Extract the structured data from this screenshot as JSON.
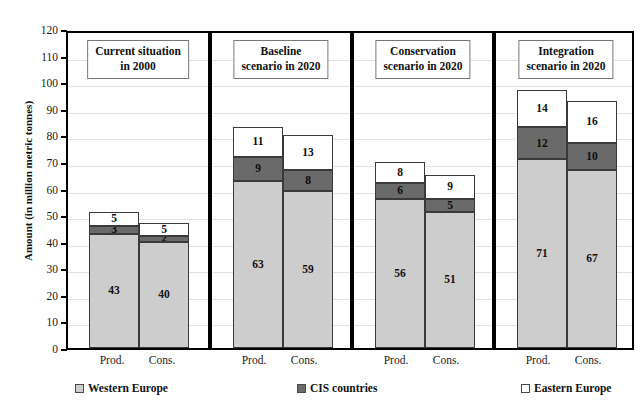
{
  "chart_data": {
    "type": "bar",
    "title": "in 2020 under the three alternative scenarios",
    "xlabel": "",
    "ylabel": "Amount (in million metric tonnes)",
    "ylim": [
      0,
      120
    ],
    "ytick_step": 10,
    "yticks": [
      "0",
      "10",
      "20",
      "30",
      "40",
      "50",
      "60",
      "70",
      "80",
      "90",
      "100",
      "110",
      "120"
    ],
    "grid": true,
    "legend_position": "bottom",
    "stacked": true,
    "series": [
      {
        "name": "Western Europe",
        "color": "#cdcdcd"
      },
      {
        "name": "CIS countries",
        "color": "#6a6a6a"
      },
      {
        "name": "Eastern Europe",
        "color": "#ffffff"
      }
    ],
    "panels": [
      {
        "header": "Current   situation\nin 2000",
        "header_line1": "Current   situation",
        "header_line2": "in 2000",
        "bars": [
          {
            "category": "Prod.",
            "western": 43,
            "cis": 3,
            "eastern": 5,
            "total": 51
          },
          {
            "category": "Cons.",
            "western": 40,
            "cis": 2,
            "eastern": 5,
            "total": 47
          }
        ]
      },
      {
        "header": "Baseline\nscenario in 2020",
        "header_line1": "Baseline",
        "header_line2": "scenario in 2020",
        "bars": [
          {
            "category": "Prod.",
            "western": 63,
            "cis": 9,
            "eastern": 11,
            "total": 83
          },
          {
            "category": "Cons.",
            "western": 59,
            "cis": 8,
            "eastern": 13,
            "total": 80
          }
        ]
      },
      {
        "header": "Conservation\nscenario in 2020",
        "header_line1": "Conservation",
        "header_line2": "scenario in 2020",
        "bars": [
          {
            "category": "Prod.",
            "western": 56,
            "cis": 6,
            "eastern": 8,
            "total": 70
          },
          {
            "category": "Cons.",
            "western": 51,
            "cis": 5,
            "eastern": 9,
            "total": 65
          }
        ]
      },
      {
        "header": "Integration\nscenario in 2020",
        "header_line1": "Integration",
        "header_line2": "scenario in 2020",
        "bars": [
          {
            "category": "Prod.",
            "western": 71,
            "cis": 12,
            "eastern": 14,
            "total": 97
          },
          {
            "category": "Cons.",
            "western": 67,
            "cis": 10,
            "eastern": 16,
            "total": 93
          }
        ]
      }
    ]
  }
}
